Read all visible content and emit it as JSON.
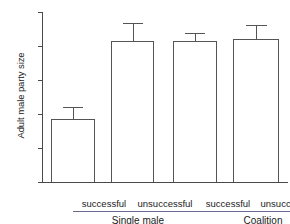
{
  "chart_data": {
    "type": "bar",
    "title": "",
    "xlabel": "",
    "ylabel": "Adult male party size",
    "ylim": [
      0,
      20
    ],
    "yticks": [
      0,
      4,
      8,
      12,
      16,
      20
    ],
    "ytick_labels": [
      "0",
      "4",
      "8",
      "12",
      "16",
      "20"
    ],
    "grid": false,
    "legend": null,
    "categories": [
      "successful",
      "unsuccessful",
      "successful",
      "unsuccessful"
    ],
    "groups": [
      {
        "label": "Single male",
        "categories": [
          "successful",
          "unsuccessful"
        ]
      },
      {
        "label": "Coalition",
        "categories": [
          "successful",
          "unsuccessful"
        ]
      }
    ],
    "values": [
      7.4,
      16.6,
      16.6,
      16.8
    ],
    "errors_upper": [
      8.8,
      18.7,
      17.5,
      18.5
    ],
    "bars": [
      {
        "category": "successful",
        "group": "Single male",
        "value": 7.4,
        "error_top": 8.8
      },
      {
        "category": "unsuccessful",
        "group": "Single male",
        "value": 16.6,
        "error_top": 18.7
      },
      {
        "category": "successful",
        "group": "Coalition",
        "value": 16.6,
        "error_top": 17.5
      },
      {
        "category": "unsuccessful",
        "group": "Coalition",
        "value": 16.8,
        "error_top": 18.5
      }
    ],
    "colors": {
      "bar_fill": "#ffffff",
      "bar_edge": "#555555",
      "axis": "#4a4a4a",
      "text": "#1a1a1a",
      "group_rule": "#6b6b8f"
    }
  }
}
